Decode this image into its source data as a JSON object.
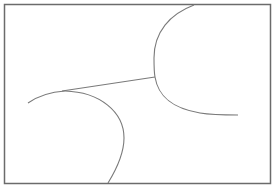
{
  "diagram": {
    "frame": {
      "x": 4.5,
      "y": 4.5,
      "width": 266,
      "height": 179,
      "stroke": "#6b6b6b",
      "stroke_width": 1.5
    },
    "line_color": "#7a7a7a",
    "paths": [
      {
        "name": "upper-right-curve-top",
        "d": "M194,5 C170,14 154,32 154,58 C154,66 154,72 155,77"
      },
      {
        "name": "upper-right-curve-bottom",
        "d": "M155,77 C158,95 170,108 200,113 C212,115 225,115 238,115"
      },
      {
        "name": "connector-line",
        "d": "M62,91 L155,77"
      },
      {
        "name": "lower-left-curve-left",
        "d": "M28,103 C38,96 50,92 65,91"
      },
      {
        "name": "lower-left-curve-right",
        "d": "M65,91 C100,92 124,112 124,138 C124,155 116,170 108,183"
      }
    ]
  }
}
